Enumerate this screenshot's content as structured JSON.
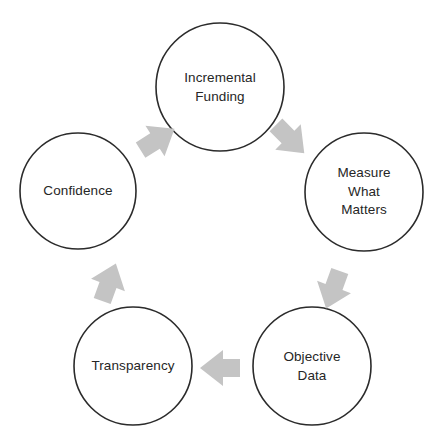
{
  "diagram": {
    "type": "circular-cycle",
    "background_color": "#ffffff",
    "circle_fill": "#ffffff",
    "circle_stroke": "#2b2b2b",
    "arrow_color": "#c4c4c4",
    "text_color": "#262626",
    "nodes": [
      {
        "id": "incremental-funding",
        "label": "Incremental\nFunding",
        "cx": 220,
        "cy": 87,
        "r": 64
      },
      {
        "id": "measure-what-matters",
        "label": "Measure\nWhat\nMatters",
        "cx": 364,
        "cy": 192,
        "r": 59
      },
      {
        "id": "objective-data",
        "label": "Objective\nData",
        "cx": 312,
        "cy": 366,
        "r": 59
      },
      {
        "id": "transparency",
        "label": "Transparency",
        "cx": 133,
        "cy": 366,
        "r": 59
      },
      {
        "id": "confidence",
        "label": "Confidence",
        "cx": 78,
        "cy": 191,
        "r": 58
      }
    ],
    "arrows": [
      {
        "id": "arrow-funding-to-measure",
        "from": "incremental-funding",
        "to": "measure-what-matters",
        "direction_deg": 45,
        "cx": 288,
        "cy": 137
      },
      {
        "id": "arrow-measure-to-objective",
        "from": "measure-what-matters",
        "to": "objective-data",
        "direction_deg": 110,
        "cx": 334,
        "cy": 287
      },
      {
        "id": "arrow-objective-to-transparency",
        "from": "objective-data",
        "to": "transparency",
        "direction_deg": 180,
        "cx": 223,
        "cy": 368
      },
      {
        "id": "arrow-transparency-to-confidence",
        "from": "transparency",
        "to": "confidence",
        "direction_deg": 290,
        "cx": 108,
        "cy": 285
      },
      {
        "id": "arrow-confidence-to-funding",
        "from": "confidence",
        "to": "incremental-funding",
        "direction_deg": 328,
        "cx": 155,
        "cy": 141
      }
    ]
  }
}
